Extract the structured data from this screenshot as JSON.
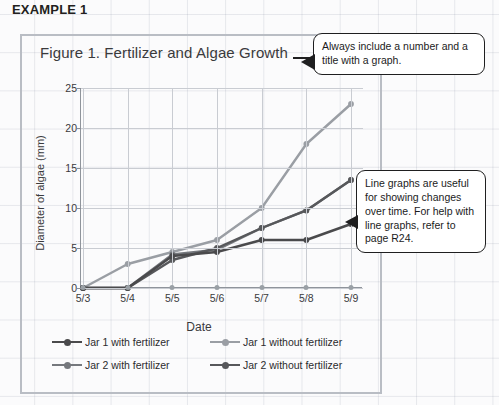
{
  "example_label": "EXAMPLE 1",
  "chart_data": {
    "type": "line",
    "title": "Figure 1. Fertilizer and Algae Growth",
    "xlabel": "Date",
    "ylabel": "Diameter of algae (mm)",
    "categories": [
      "5/3",
      "5/4",
      "5/5",
      "5/6",
      "5/7",
      "5/8",
      "5/9"
    ],
    "ylim": [
      0,
      25
    ],
    "yticks": [
      0,
      5,
      10,
      15,
      20,
      25
    ],
    "grid": true,
    "legend_position": "bottom",
    "series": [
      {
        "name": "Jar 1 with fertilizer",
        "color": "#4a4a4c",
        "values": [
          0,
          0,
          4.0,
          4.5,
          6.0,
          6.0,
          8.0
        ]
      },
      {
        "name": "Jar 1 without fertilizer",
        "color": "#9a9ea4",
        "values": [
          0,
          3.0,
          4.5,
          6.0,
          10.0,
          18.0,
          23.0
        ]
      },
      {
        "name": "Jar 2 with fertilizer",
        "color": "#75787d",
        "values": [
          0,
          0,
          4.2,
          4.8,
          7.5,
          9.7,
          13.5
        ]
      },
      {
        "name": "Jar 2 without fertilizer",
        "color": "#57585b",
        "values": [
          0,
          0,
          3.5,
          5.0,
          7.5,
          9.7,
          13.5
        ]
      }
    ]
  },
  "callouts": [
    {
      "id": "title-callout",
      "text": "Always include a number and a title with a graph."
    },
    {
      "id": "line-callout",
      "text": "Line graphs are useful for showing changes over time. For help with line graphs, refer to page R24."
    }
  ],
  "colors": {
    "panel_border": "#b9bdc4",
    "axis": "#8f949b",
    "gridline": "#c9ccd2",
    "callout_border": "#1f1f20",
    "text": "#231f20"
  }
}
